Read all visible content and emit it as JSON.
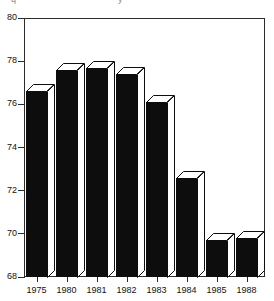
{
  "title_fragment": {
    "left_text": "q",
    "right_text": "y"
  },
  "chart_data": {
    "type": "bar",
    "title": "",
    "subtitle": "",
    "xlabel": "",
    "ylabel": "",
    "categories": [
      "1975",
      "1980",
      "1981",
      "1982",
      "1983",
      "1984",
      "1985",
      "1988"
    ],
    "values": [
      76.6,
      77.6,
      77.7,
      77.4,
      76.1,
      72.6,
      69.7,
      69.8
    ],
    "series": [
      {
        "name": "",
        "values": [
          76.6,
          77.6,
          77.7,
          77.4,
          76.1,
          72.6,
          69.7,
          69.8
        ]
      }
    ],
    "ylim": [
      68,
      80
    ],
    "xlim": [
      0,
      8
    ],
    "ytick_labels": [
      "80",
      "78",
      "76",
      "74",
      "72",
      "70",
      "68"
    ],
    "ytick_values": [
      80,
      78,
      76,
      74,
      72,
      70,
      68
    ],
    "xtick_labels": [
      "1975",
      "1980",
      "1981",
      "1982",
      "1983",
      "1984",
      "1985",
      "1988"
    ],
    "grid": false,
    "legend": null,
    "legend_position": "none",
    "bar_style": "3d-block",
    "bar_color": "#0d0d0d",
    "frame_color": "#2b2b2b",
    "background_color": "#ffffff",
    "annotations": []
  },
  "axis": {
    "y_labels": [
      "80",
      "78",
      "76",
      "74",
      "72",
      "70",
      "68"
    ],
    "x_labels": [
      "1975",
      "1980",
      "1981",
      "1982",
      "1983",
      "1984",
      "1985",
      "1988"
    ]
  }
}
